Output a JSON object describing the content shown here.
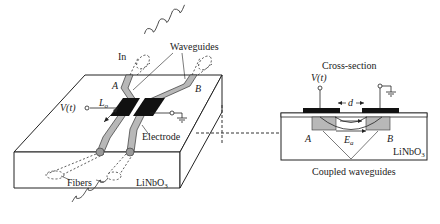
{
  "diagram": {
    "type": "electro-optic directional coupler",
    "perspective_view": {
      "labels": {
        "in": "In",
        "waveguides": "Waveguides",
        "port_a": "A",
        "port_b": "B",
        "voltage": "V(t)",
        "length": "L",
        "length_sub": "o",
        "electrode": "Electrode",
        "fibers": "Fibers",
        "substrate": "LiNbO",
        "substrate_sub": "3"
      }
    },
    "cross_section": {
      "labels": {
        "title": "Cross-section",
        "voltage": "V(t)",
        "gap": "d",
        "port_a": "A",
        "port_b": "B",
        "field": "E",
        "field_sub": "a",
        "substrate": "LiNbO",
        "substrate_sub": "3",
        "caption": "Coupled waveguides"
      }
    },
    "colors": {
      "line": "#222222",
      "waveguide_fill": "#b8b8b8",
      "electrode_fill": "#111111",
      "background": "#ffffff"
    }
  }
}
